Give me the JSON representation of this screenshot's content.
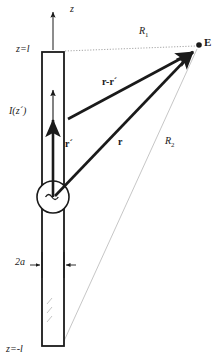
{
  "figure": {
    "background_color": "#ffffff",
    "ink_color": "#1a1a1a",
    "faint_color": "#b4b4b4"
  },
  "labels": {
    "z_axis": "z",
    "z_top": "z=l",
    "z_bottom": "z=-l",
    "current": "I(z´)",
    "radius": "2a",
    "R1": "R",
    "R1_sub": "1",
    "R2": "R",
    "R2_sub": "2",
    "r_minus_r_prime": "r-r´",
    "r_prime": "r´",
    "r": "r",
    "field_point": "E"
  },
  "elements": {
    "antenna": {
      "name": "dipole-antenna-body",
      "x": 42,
      "y": 52,
      "width": 22,
      "height": 294,
      "top_label": "z=l",
      "bottom_label": "z=-l"
    },
    "source": {
      "name": "ac-source",
      "symbol": "~",
      "cx": 53,
      "cy": 197,
      "r": 16
    },
    "field_point": {
      "name": "observation-point-E",
      "label": "E",
      "cx": 199,
      "cy": 45
    },
    "vectors": [
      {
        "name": "vector-r-prime",
        "label": "r´",
        "from": [
          53,
          197
        ],
        "to": [
          53,
          118
        ],
        "style": "bold-arrow"
      },
      {
        "name": "vector-r",
        "label": "r",
        "from": [
          53,
          197
        ],
        "to": [
          194,
          51
        ],
        "style": "bold-arrow"
      },
      {
        "name": "vector-r-minus-r-prime",
        "label": "r-r´",
        "from": [
          67,
          118
        ],
        "to": [
          194,
          51
        ],
        "style": "bold-arrow"
      },
      {
        "name": "current-arrow-upper",
        "label": "",
        "from": [
          53,
          148
        ],
        "to": [
          53,
          88
        ],
        "style": "thin-arrow"
      }
    ],
    "distance_lines": [
      {
        "name": "distance-line-R1",
        "label": "R1",
        "from": [
          64,
          52
        ],
        "to": [
          196,
          46
        ],
        "style": "dotted"
      },
      {
        "name": "distance-line-R2",
        "label": "R2",
        "from": [
          64,
          340
        ],
        "to": [
          197,
          48
        ],
        "style": "thin-faint"
      }
    ],
    "dimension_marker": {
      "name": "dimension-2a",
      "label": "2a",
      "left_arrow_from": [
        31,
        265
      ],
      "left_arrow_to": [
        42,
        265
      ],
      "right_arrow_from": [
        75,
        265
      ],
      "right_arrow_to": [
        64,
        265
      ]
    },
    "z_axis_arrow": {
      "name": "z-axis-arrow",
      "from": [
        53,
        48
      ],
      "to": [
        53,
        10
      ]
    }
  }
}
